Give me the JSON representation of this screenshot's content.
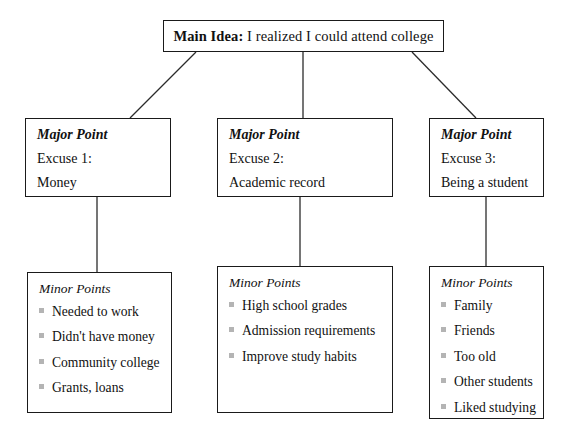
{
  "diagram": {
    "type": "hierarchical-outline-tree",
    "main_idea": {
      "label": "Main Idea:",
      "text": " I realized I could attend college"
    },
    "columns": [
      {
        "major": {
          "title": "Major Point",
          "line1": "Excuse 1:",
          "line2": "Money"
        },
        "minor": {
          "title": "Minor Points",
          "items": [
            "Needed to work",
            "Didn't have money",
            "Community college",
            "Grants, loans"
          ]
        }
      },
      {
        "major": {
          "title": "Major Point",
          "line1": "Excuse 2:",
          "line2": "Academic record"
        },
        "minor": {
          "title": "Minor Points",
          "items": [
            "High school grades",
            "Admission requirements",
            "Improve study habits"
          ]
        }
      },
      {
        "major": {
          "title": "Major Point",
          "line1": "Excuse 3:",
          "line2": "Being a student"
        },
        "minor": {
          "title": "Minor Points",
          "items": [
            "Family",
            "Friends",
            "Too old",
            "Other students",
            "Liked studying"
          ]
        }
      }
    ],
    "colors": {
      "border": "#1a1a1a",
      "text": "#111111",
      "bullet": "#b4b4b4",
      "background": "#ffffff",
      "connector": "#2b2b2b"
    }
  }
}
